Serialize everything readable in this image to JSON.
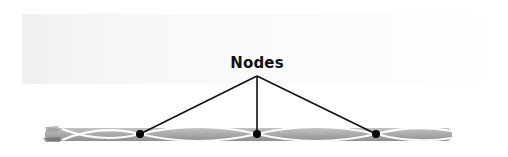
{
  "diagram": {
    "type": "standing-wave-annotation",
    "label": "Nodes",
    "colors": {
      "background": "#ffffff",
      "string_dark": "#8a8a8a",
      "string_light": "#c4c4c4",
      "highlight": "#ffffff",
      "node": "#000000",
      "pointer_line": "#111111",
      "label_text": "#111111"
    },
    "label_anchor": {
      "x": 257,
      "y": 76
    },
    "nodes": [
      {
        "id": "node-1",
        "x": 140,
        "y": 134
      },
      {
        "id": "node-2",
        "x": 257,
        "y": 134
      },
      {
        "id": "node-3",
        "x": 376,
        "y": 134
      }
    ],
    "string": {
      "x_start": 45,
      "x_end": 452,
      "y_top": 126,
      "y_bottom": 142
    }
  }
}
